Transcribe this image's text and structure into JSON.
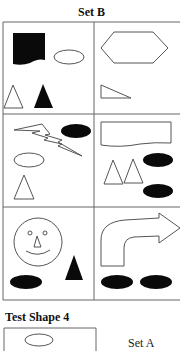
{
  "set_b": {
    "title": "Set B",
    "cells": [
      {
        "row": 1,
        "col": 1,
        "shapes": [
          "black-wavy-bottom-square",
          "outline-ellipse",
          "outline-triangle",
          "black-triangle"
        ]
      },
      {
        "row": 1,
        "col": 2,
        "shapes": [
          "outline-hexagon",
          "outline-right-triangle"
        ]
      },
      {
        "row": 2,
        "col": 1,
        "shapes": [
          "outline-lightning-bolt",
          "black-ellipse",
          "outline-ellipse",
          "outline-triangle"
        ]
      },
      {
        "row": 2,
        "col": 2,
        "shapes": [
          "outline-wavy-bottom-rectangle",
          "outline-triangle",
          "outline-triangle",
          "black-ellipse",
          "black-ellipse"
        ]
      },
      {
        "row": 3,
        "col": 1,
        "shapes": [
          "outline-smiley-face",
          "black-triangle",
          "black-ellipse"
        ]
      },
      {
        "row": 3,
        "col": 2,
        "shapes": [
          "outline-curved-arrow",
          "black-ellipse",
          "black-ellipse"
        ]
      }
    ]
  },
  "test_shape": {
    "title": "Test Shape 4",
    "shapes": [
      "outline-ellipse"
    ]
  },
  "set_a_label": "Set A",
  "colors": {
    "line": "#555555",
    "fill": "#0a0a0a"
  }
}
